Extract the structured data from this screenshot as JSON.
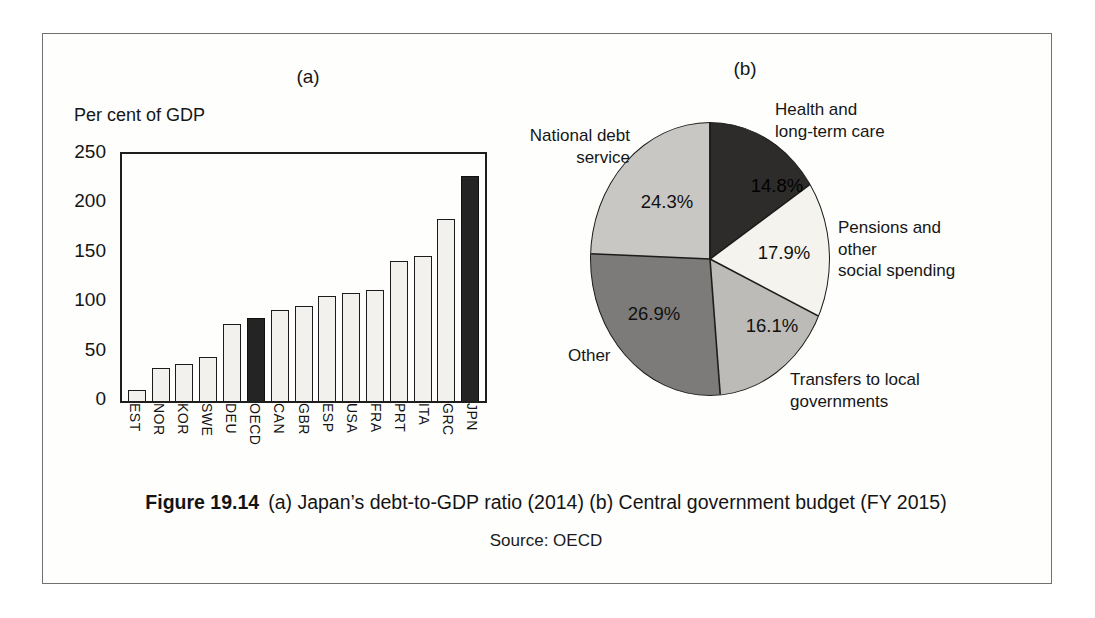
{
  "figure": {
    "caption_label": "Figure 19.14",
    "caption_text": "(a) Japan’s debt-to-GDP ratio (2014) (b) Central government budget (FY 2015)",
    "source": "Source: OECD"
  },
  "chart_data": [
    {
      "type": "bar",
      "panel_label": "(a)",
      "axis_title": "Per cent of GDP",
      "categories": [
        "EST",
        "NOR",
        "KOR",
        "SWE",
        "DEU",
        "OECD",
        "CAN",
        "GBR",
        "ESP",
        "USA",
        "FRA",
        "PRT",
        "ITA",
        "GRC",
        "JPN"
      ],
      "values": [
        11,
        33,
        37,
        45,
        78,
        84,
        92,
        96,
        106,
        109,
        112,
        142,
        147,
        184,
        228
      ],
      "highlighted": [
        "OECD",
        "JPN"
      ],
      "ylim": [
        0,
        250
      ],
      "yticks": [
        250,
        200,
        150,
        100,
        50,
        0
      ],
      "bar_color": "#f2f1ed",
      "highlight_color": "#242424",
      "grid": false,
      "legend": "none"
    },
    {
      "type": "pie",
      "panel_label": "(b)",
      "start_angle_deg": 0,
      "direction": "clockwise",
      "slices": [
        {
          "label": "Health and\nlong-term care",
          "value_pct": 14.8,
          "display": "14.8%",
          "color": "#2e2c2a"
        },
        {
          "label": "Pensions and\nother\nsocial spending",
          "value_pct": 17.9,
          "display": "17.9%",
          "color": "#f5f3ee"
        },
        {
          "label": "Transfers to local\ngovernments",
          "value_pct": 16.1,
          "display": "16.1%",
          "color": "#bdbbb8"
        },
        {
          "label": "Other",
          "value_pct": 26.9,
          "display": "26.9%",
          "color": "#7d7b79"
        },
        {
          "label": "National debt\nservice",
          "value_pct": 24.3,
          "display": "24.3%",
          "color": "#c9c7c4"
        }
      ]
    }
  ]
}
